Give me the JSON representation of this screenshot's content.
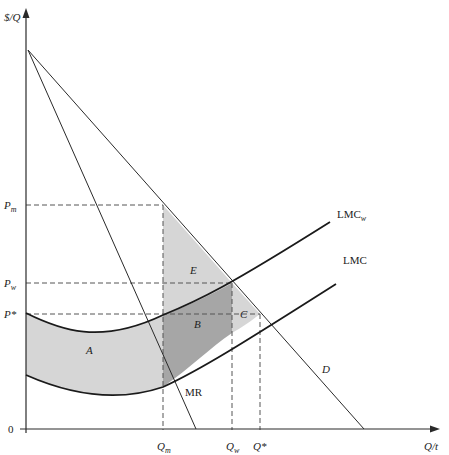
{
  "diagram": {
    "type": "economics-monopsony-welfare",
    "axes": {
      "y_label": "$/Q",
      "x_label": "Q/t",
      "origin_label": "0"
    },
    "price_labels": {
      "pm": "P",
      "pm_sub": "m",
      "pw": "P",
      "pw_sub": "w",
      "pstar": "P*"
    },
    "quantity_labels": {
      "qm": "Q",
      "qm_sub": "m",
      "qw": "Q",
      "qw_sub": "w",
      "qstar": "Q*"
    },
    "curves": {
      "lmcw": "LMC",
      "lmcw_sub": "w",
      "lmc": "LMC",
      "mr": "MR",
      "d": "D"
    },
    "regions": {
      "a": "A",
      "b": "B",
      "c": "C",
      "e": "E"
    },
    "colors": {
      "light_fill": "#d6d6d6",
      "dark_fill": "#a6a6a6",
      "line": "#2a2a2a",
      "dash": "#555555"
    }
  }
}
